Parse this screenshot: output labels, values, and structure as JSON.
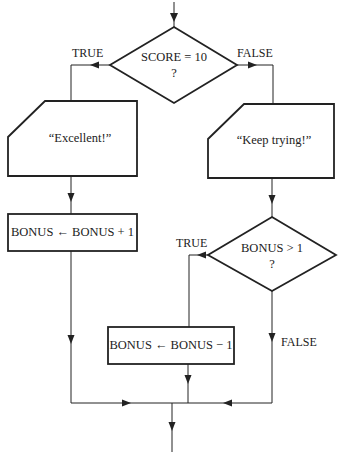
{
  "diagram": {
    "type": "flowchart",
    "colors": {
      "stroke": "#222222",
      "background": "#ffffff",
      "text": "#222222"
    },
    "nodes": {
      "decision1": {
        "line1": "SCORE = 10",
        "line2": "?"
      },
      "output_excellent": {
        "text": "“Excellent!”"
      },
      "output_keep_trying": {
        "text": "“Keep trying!”"
      },
      "process_increment": {
        "text": "BONUS ← BONUS + 1"
      },
      "decision2": {
        "line1": "BONUS > 1",
        "line2": "?"
      },
      "process_decrement": {
        "text": "BONUS ← BONUS − 1"
      }
    },
    "edge_labels": {
      "decision1_true": "TRUE",
      "decision1_false": "FALSE",
      "decision2_true": "TRUE",
      "decision2_false": "FALSE"
    }
  }
}
